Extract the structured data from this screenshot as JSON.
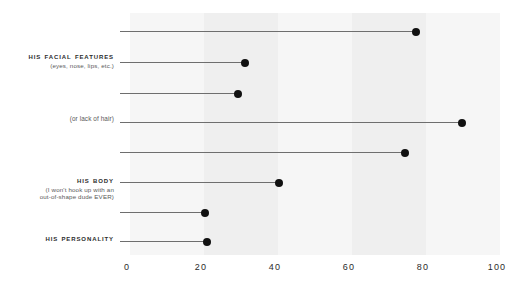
{
  "chart_data": {
    "type": "bar",
    "subtype": "lollipop-horizontal",
    "title": "",
    "xlabel": "",
    "ylabel": "",
    "xlim": [
      0,
      100
    ],
    "xticks": [
      0,
      20,
      40,
      60,
      80,
      100
    ],
    "grid": false,
    "legend": null,
    "bands": true,
    "categories": [
      "His Facial Features",
      "His Hair",
      "His Body",
      "His Personality",
      "His Intelligence",
      "His Height",
      "His Penis Size",
      "Other"
    ],
    "values": [
      78,
      32,
      30,
      90.5,
      75,
      41,
      21,
      21.5
    ],
    "annotations": [
      "(eyes, nose, lips, etc.)",
      "(or lack of hair)",
      "(I won't hook up with an out-of-shape dude EVER)"
    ]
  },
  "colors": {
    "dot": "#111111",
    "line": "#6e6e6e",
    "band": "#efefef",
    "band_light": "#f6f6f6",
    "plot_bg": "#fbfbfb",
    "text": "#2b2b2b",
    "subtext": "#595959",
    "page_bg": "#ffffff"
  },
  "rows": [
    {
      "label": "His Facial Features",
      "label_first": "H",
      "label_rest": "is Facial Features",
      "sub": "(eyes, nose, lips, etc.)",
      "inline_sub": "",
      "value": 78
    },
    {
      "label": "His Hair",
      "label_first": "H",
      "label_rest": "is Hair",
      "sub": "",
      "inline_sub": "(or lack of hair)",
      "value": 32
    },
    {
      "label": "His Body",
      "label_first": "H",
      "label_rest": "is Body",
      "sub": "(I won't hook up with an",
      "sub2": "out-of-shape dude EVER)",
      "inline_sub": "",
      "value": 30
    },
    {
      "label": "His Personality",
      "label_first": "H",
      "label_rest": "is Personality",
      "sub": "",
      "inline_sub": "",
      "value": 90.5
    },
    {
      "label": "His Intelligence",
      "label_first": "H",
      "label_rest": "is Intelligence",
      "sub": "",
      "inline_sub": "",
      "value": 75
    },
    {
      "label": "His Height",
      "label_first": "H",
      "label_rest": "is Height",
      "sub": "",
      "inline_sub": "",
      "value": 41
    },
    {
      "label": "His Penis Size",
      "label_first": "H",
      "label_rest": "is Penis Size",
      "sub": "",
      "inline_sub": "",
      "value": 21
    },
    {
      "label": "Other",
      "label_first": "O",
      "label_rest": "ther",
      "sub": "",
      "inline_sub": "",
      "value": 21.5
    }
  ],
  "axis": {
    "ticks": [
      "0",
      "20",
      "40",
      "60",
      "80",
      "100"
    ]
  }
}
